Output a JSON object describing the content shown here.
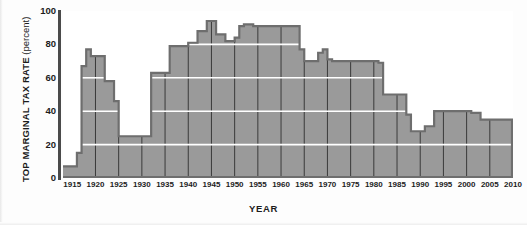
{
  "chart_data": {
    "type": "area",
    "title": "",
    "xlabel": "YEAR",
    "ylabel_main": "TOP MARGINAL TAX RATE",
    "ylabel_unit": "(percent)",
    "ylabel": "TOP MARGINAL TAX RATE (percent)",
    "xlim": [
      1913,
      2010
    ],
    "ylim": [
      0,
      100
    ],
    "yticks": [
      0,
      20,
      40,
      60,
      80,
      100
    ],
    "ytick_labels": [
      "0",
      "20",
      "40",
      "60",
      "80",
      "100"
    ],
    "xticks": [
      1915,
      1920,
      1925,
      1930,
      1935,
      1940,
      1945,
      1950,
      1955,
      1960,
      1965,
      1970,
      1975,
      1980,
      1985,
      1990,
      1995,
      2000,
      2005,
      2010
    ],
    "xtick_labels": [
      "1915",
      "1920",
      "1925",
      "1930",
      "1935",
      "1940",
      "1945",
      "1950",
      "1955",
      "1960",
      "1965",
      "1970",
      "1975",
      "1980",
      "1985",
      "1990",
      "1995",
      "2000",
      "2005",
      "2010"
    ],
    "grid": {
      "horizontal": true,
      "horizontal_values": [
        20,
        40,
        60,
        80
      ],
      "vertical": true,
      "vertical_values": [
        1920,
        1925,
        1930,
        1935,
        1940,
        1945,
        1950,
        1955,
        1960,
        1965,
        1970,
        1975,
        1980,
        1985,
        1990,
        1995,
        2000,
        2005
      ]
    },
    "legend": null,
    "colors": {
      "fill": "#9a9a9a",
      "outline": "#6e6e6e",
      "horizontal_gridline": "#ffffff",
      "vertical_gridline": "#3a3a3a",
      "axis": "#4a4a4a",
      "text": "#1c1c1c",
      "plot_background": "#ffffff"
    },
    "x": [
      1913,
      1916,
      1917,
      1918,
      1919,
      1921,
      1922,
      1924,
      1925,
      1932,
      1936,
      1938,
      1940,
      1941,
      1942,
      1944,
      1946,
      1948,
      1950,
      1951,
      1952,
      1954,
      1964,
      1965,
      1968,
      1969,
      1970,
      1971,
      1981,
      1982,
      1987,
      1988,
      1991,
      1993,
      2001,
      2002,
      2003,
      2010
    ],
    "values": [
      7,
      15,
      67,
      77,
      73,
      73,
      58,
      46,
      25,
      63,
      79,
      79,
      81,
      81,
      88,
      94,
      86,
      82,
      84,
      91,
      92,
      91,
      77,
      70,
      75,
      77,
      71,
      70,
      69,
      50,
      38,
      28,
      31,
      40,
      39,
      39,
      35,
      35
    ],
    "series": [
      {
        "name": "Top marginal tax rate",
        "step_points": [
          {
            "year": 1913,
            "rate": 7
          },
          {
            "year": 1916,
            "rate": 15
          },
          {
            "year": 1917,
            "rate": 67
          },
          {
            "year": 1918,
            "rate": 77
          },
          {
            "year": 1919,
            "rate": 73
          },
          {
            "year": 1922,
            "rate": 58
          },
          {
            "year": 1924,
            "rate": 46
          },
          {
            "year": 1925,
            "rate": 25
          },
          {
            "year": 1932,
            "rate": 63
          },
          {
            "year": 1936,
            "rate": 79
          },
          {
            "year": 1940,
            "rate": 81
          },
          {
            "year": 1942,
            "rate": 88
          },
          {
            "year": 1944,
            "rate": 94
          },
          {
            "year": 1946,
            "rate": 86
          },
          {
            "year": 1948,
            "rate": 82
          },
          {
            "year": 1950,
            "rate": 84
          },
          {
            "year": 1951,
            "rate": 91
          },
          {
            "year": 1952,
            "rate": 92
          },
          {
            "year": 1954,
            "rate": 91
          },
          {
            "year": 1964,
            "rate": 77
          },
          {
            "year": 1965,
            "rate": 70
          },
          {
            "year": 1968,
            "rate": 75
          },
          {
            "year": 1969,
            "rate": 77
          },
          {
            "year": 1970,
            "rate": 71
          },
          {
            "year": 1971,
            "rate": 70
          },
          {
            "year": 1981,
            "rate": 69
          },
          {
            "year": 1982,
            "rate": 50
          },
          {
            "year": 1987,
            "rate": 38
          },
          {
            "year": 1988,
            "rate": 28
          },
          {
            "year": 1991,
            "rate": 31
          },
          {
            "year": 1993,
            "rate": 40
          },
          {
            "year": 2001,
            "rate": 39
          },
          {
            "year": 2003,
            "rate": 35
          },
          {
            "year": 2010,
            "rate": 35
          }
        ]
      }
    ]
  }
}
